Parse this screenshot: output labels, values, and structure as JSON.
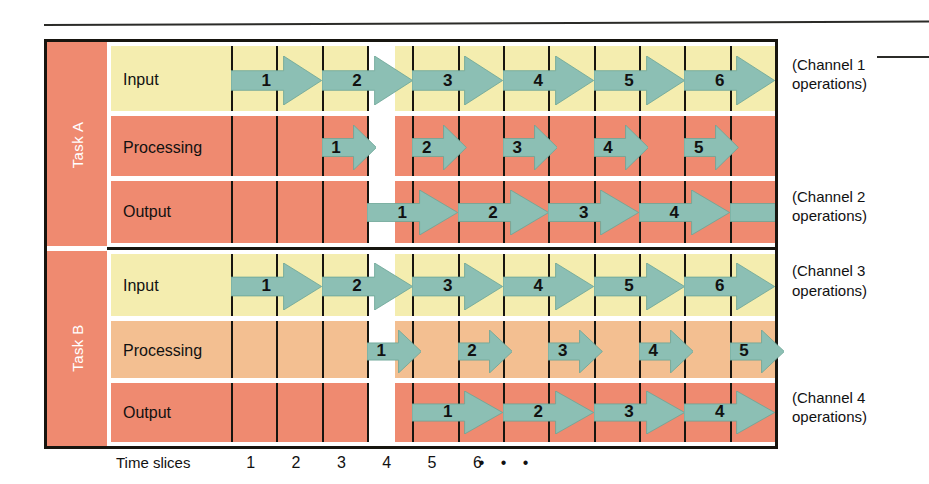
{
  "figure": {
    "axis_title": "Time slices",
    "time_ticks": [
      "1",
      "2",
      "3",
      "4",
      "5",
      "6"
    ],
    "continuation": "• • •"
  },
  "colors": {
    "task_spine": "#ef8a70",
    "input_row": "#f4edaf",
    "processing_row_a": "#ef8a70",
    "processing_row_b": "#f3bf91",
    "output_row": "#ef8a70",
    "arrow": "#8cbfb4",
    "arrow_outline": "#6ba495",
    "frame": "#17150f",
    "blank_column": "#ffffff"
  },
  "tasks": [
    {
      "id": "task-a",
      "label": "Task A",
      "rows": [
        {
          "id": "task-a-input",
          "label": "Input",
          "caption": [
            "(Channel 1",
            "operations)"
          ],
          "arrows": [
            {
              "num": "1",
              "start": 0,
              "end": 2
            },
            {
              "num": "2",
              "start": 2,
              "end": 4
            },
            {
              "num": "3",
              "start": 4,
              "end": 6
            },
            {
              "num": "4",
              "start": 6,
              "end": 8
            },
            {
              "num": "5",
              "start": 8,
              "end": 10
            },
            {
              "num": "6",
              "start": 10,
              "end": 12
            }
          ]
        },
        {
          "id": "task-a-processing",
          "label": "Processing",
          "caption": null,
          "arrows": [
            {
              "num": "1",
              "start": 2,
              "end": 3.2
            },
            {
              "num": "2",
              "start": 4,
              "end": 5.2
            },
            {
              "num": "3",
              "start": 6,
              "end": 7.2
            },
            {
              "num": "4",
              "start": 8,
              "end": 9.2
            },
            {
              "num": "5",
              "start": 10,
              "end": 11.2
            }
          ]
        },
        {
          "id": "task-a-output",
          "label": "Output",
          "caption": [
            "(Channel 2",
            "operations)"
          ],
          "arrows": [
            {
              "num": "1",
              "start": 3,
              "end": 5
            },
            {
              "num": "2",
              "start": 5,
              "end": 7
            },
            {
              "num": "3",
              "start": 7,
              "end": 9
            },
            {
              "num": "4",
              "start": 9,
              "end": 11
            },
            {
              "num": "",
              "start": 11,
              "end": 12
            }
          ]
        }
      ]
    },
    {
      "id": "task-b",
      "label": "Task B",
      "rows": [
        {
          "id": "task-b-input",
          "label": "Input",
          "caption": [
            "(Channel 3",
            "operations)"
          ],
          "arrows": [
            {
              "num": "1",
              "start": 0,
              "end": 2
            },
            {
              "num": "2",
              "start": 2,
              "end": 4
            },
            {
              "num": "3",
              "start": 4,
              "end": 6
            },
            {
              "num": "4",
              "start": 6,
              "end": 8
            },
            {
              "num": "5",
              "start": 8,
              "end": 10
            },
            {
              "num": "6",
              "start": 10,
              "end": 12
            }
          ]
        },
        {
          "id": "task-b-processing",
          "label": "Processing",
          "caption": null,
          "arrows": [
            {
              "num": "1",
              "start": 3,
              "end": 4.2
            },
            {
              "num": "2",
              "start": 5,
              "end": 6.2
            },
            {
              "num": "3",
              "start": 7,
              "end": 8.2
            },
            {
              "num": "4",
              "start": 9,
              "end": 10.2
            },
            {
              "num": "5",
              "start": 11,
              "end": 12.2
            }
          ]
        },
        {
          "id": "task-b-output",
          "label": "Output",
          "caption": [
            "(Channel 4",
            "operations)"
          ],
          "arrows": [
            {
              "num": "1",
              "start": 4,
              "end": 6
            },
            {
              "num": "2",
              "start": 6,
              "end": 8
            },
            {
              "num": "3",
              "start": 8,
              "end": 10
            },
            {
              "num": "4",
              "start": 10,
              "end": 12
            }
          ]
        }
      ]
    }
  ]
}
